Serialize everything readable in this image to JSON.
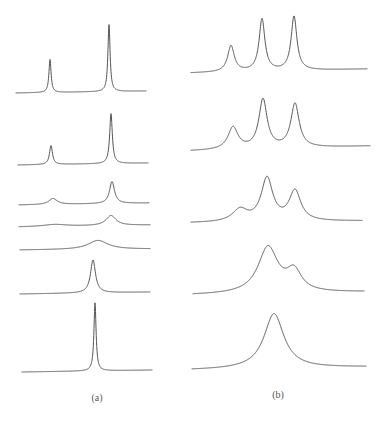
{
  "chart_data": [
    {
      "type": "line",
      "title": "",
      "panel_label": "(a)",
      "xlabel": "",
      "ylabel": "",
      "grid": false,
      "axes": "none",
      "description": "Stacked spectra: two well-separated sharp lines broadening, merging, and re-narrowing into a single sharp line (top to bottom)",
      "series": [
        {
          "name": "trace-1",
          "x_start": 16,
          "x_end": 146,
          "baseline_start": 93,
          "baseline_end": 91,
          "peaks": [
            {
              "x": 50,
              "height": 33,
              "width": 1.3
            },
            {
              "x": 109,
              "height": 67,
              "width": 1.3
            }
          ]
        },
        {
          "name": "trace-2",
          "x_start": 18,
          "x_end": 148,
          "baseline_start": 165,
          "baseline_end": 163,
          "peaks": [
            {
              "x": 51,
              "height": 19,
              "width": 1.8
            },
            {
              "x": 111,
              "height": 50,
              "width": 1.6
            }
          ]
        },
        {
          "name": "trace-3",
          "x_start": 19,
          "x_end": 149,
          "baseline_start": 205,
          "baseline_end": 203,
          "peaks": [
            {
              "x": 53,
              "height": 6,
              "width": 5
            },
            {
              "x": 112,
              "height": 22,
              "width": 3
            }
          ]
        },
        {
          "name": "trace-4",
          "x_start": 19,
          "x_end": 150,
          "baseline_start": 227,
          "baseline_end": 225,
          "peaks": [
            {
              "x": 55,
              "height": 2,
              "width": 14
            },
            {
              "x": 111,
              "height": 10,
              "width": 6
            }
          ]
        },
        {
          "name": "trace-5",
          "x_start": 20,
          "x_end": 150,
          "baseline_start": 250,
          "baseline_end": 249,
          "peaks": [
            {
              "x": 98,
              "height": 9,
              "width": 12
            }
          ]
        },
        {
          "name": "trace-6",
          "x_start": 20,
          "x_end": 150,
          "baseline_start": 294,
          "baseline_end": 292,
          "peaks": [
            {
              "x": 93,
              "height": 33,
              "width": 3
            }
          ]
        },
        {
          "name": "trace-7",
          "x_start": 22,
          "x_end": 152,
          "baseline_start": 372,
          "baseline_end": 370,
          "peaks": [
            {
              "x": 95,
              "height": 68,
              "width": 1.3
            }
          ]
        }
      ]
    },
    {
      "type": "line",
      "title": "",
      "panel_label": "(b)",
      "xlabel": "",
      "ylabel": "",
      "grid": false,
      "axes": "none",
      "description": "Stacked spectra: three resolved lines progressively broadening and coalescing into a single broad line (top to bottom)",
      "series": [
        {
          "name": "trace-1",
          "x_start": 191,
          "x_end": 367,
          "baseline_start": 73,
          "baseline_end": 69,
          "peaks": [
            {
              "x": 231,
              "height": 26,
              "width": 4
            },
            {
              "x": 262,
              "height": 52,
              "width": 3.5
            },
            {
              "x": 294,
              "height": 54,
              "width": 3.5
            }
          ]
        },
        {
          "name": "trace-2",
          "x_start": 191,
          "x_end": 370,
          "baseline_start": 151,
          "baseline_end": 146,
          "peaks": [
            {
              "x": 233,
              "height": 22,
              "width": 6
            },
            {
              "x": 263,
              "height": 49,
              "width": 5
            },
            {
              "x": 295,
              "height": 44,
              "width": 5
            }
          ]
        },
        {
          "name": "trace-3",
          "x_start": 191,
          "x_end": 362,
          "baseline_start": 223,
          "baseline_end": 221,
          "peaks": [
            {
              "x": 240,
              "height": 12,
              "width": 9
            },
            {
              "x": 267,
              "height": 43,
              "width": 7
            },
            {
              "x": 295,
              "height": 30,
              "width": 7
            }
          ]
        },
        {
          "name": "trace-4",
          "x_start": 193,
          "x_end": 364,
          "baseline_start": 295,
          "baseline_end": 292,
          "peaks": [
            {
              "x": 268,
              "height": 46,
              "width": 12
            },
            {
              "x": 294,
              "height": 20,
              "width": 9
            }
          ]
        },
        {
          "name": "trace-5",
          "x_start": 192,
          "x_end": 366,
          "baseline_start": 370,
          "baseline_end": 367,
          "peaks": [
            {
              "x": 274,
              "height": 55,
              "width": 12
            }
          ]
        }
      ]
    }
  ],
  "labels": {
    "panel_a": "(a)",
    "panel_b": "(b)"
  },
  "colors": {
    "trace": "#555555",
    "background": "#ffffff"
  }
}
